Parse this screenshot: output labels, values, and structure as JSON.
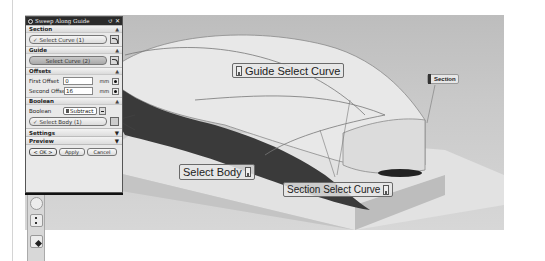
{
  "dialog": {
    "title": "Sweep Along Guide",
    "title_buttons": {
      "reset": "↺",
      "close": "✕"
    },
    "sections": {
      "section": {
        "label": "Section",
        "select_label": "Select Curve (1)",
        "collapse_icon": "▲"
      },
      "guide": {
        "label": "Guide",
        "select_label": "Select Curve (2)",
        "collapse_icon": "▲"
      },
      "offsets": {
        "label": "Offsets",
        "collapse_icon": "▲",
        "first_offset": {
          "label": "First Offset",
          "value": "0",
          "unit": "mm"
        },
        "second_offset": {
          "label": "Second Offset",
          "value": "16",
          "unit": "mm"
        }
      },
      "boolean": {
        "label": "Boolean",
        "collapse_icon": "▲",
        "field_label": "Boolean",
        "selected_option": "Subtract",
        "select_label": "Select Body (1)"
      },
      "settings": {
        "label": "Settings",
        "expand_icon": "▼"
      },
      "preview": {
        "label": "Preview",
        "expand_icon": "▼"
      }
    },
    "footer": {
      "ok": "< OK >",
      "apply": "Apply",
      "cancel": "Cancel"
    }
  },
  "viewport": {
    "callouts": {
      "guide": "Guide Select Curve",
      "body": "Select Body",
      "section": "Section Select Curve",
      "section_tag": "Section"
    }
  },
  "toolbar": {
    "icons": [
      "clock-icon",
      "list-icon",
      "pointer-icon"
    ]
  }
}
